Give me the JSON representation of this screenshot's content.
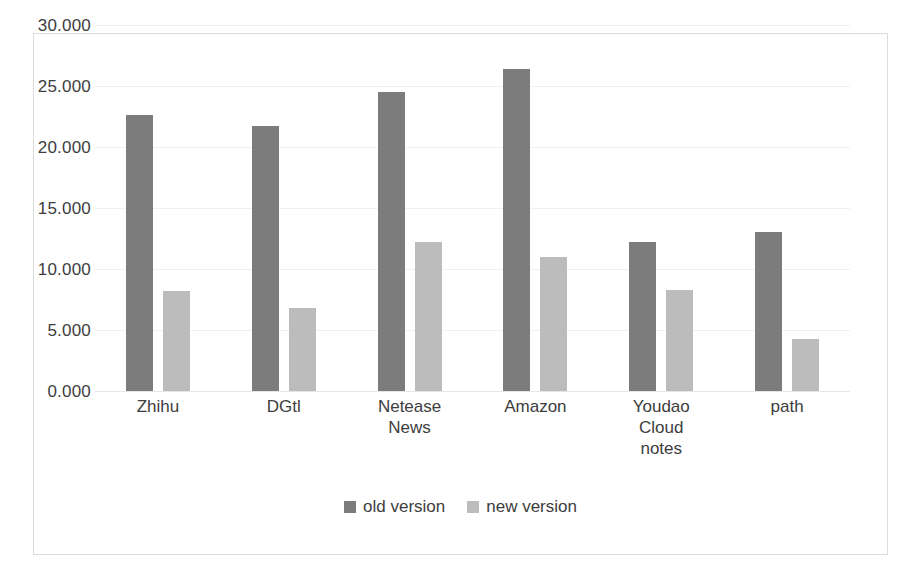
{
  "chart_data": {
    "type": "bar",
    "title": "",
    "subtitle": "",
    "xlabel": "",
    "ylabel": "",
    "ylim": [
      0,
      30
    ],
    "ytick_labels": [
      "30.000",
      "25.000",
      "20.000",
      "15.000",
      "10.000",
      "5.000",
      "0.000"
    ],
    "ytick_values": [
      30,
      25,
      20,
      15,
      10,
      5,
      0
    ],
    "grid": true,
    "legend_position": "bottom",
    "categories": [
      "Zhihu",
      "DGtl",
      "Netease\nNews",
      "Amazon",
      "Youdao\nCloud\nnotes",
      "path"
    ],
    "series": [
      {
        "name": "old version",
        "color": "#7c7c7c",
        "values": [
          22.6,
          21.7,
          24.5,
          26.4,
          12.2,
          13.0
        ]
      },
      {
        "name": "new version",
        "color": "#bcbcbc",
        "values": [
          8.2,
          6.8,
          12.2,
          11.0,
          8.3,
          4.3
        ]
      }
    ]
  },
  "legend": {
    "items": [
      {
        "label": "old version",
        "color": "#7c7c7c"
      },
      {
        "label": "new version",
        "color": "#bcbcbc"
      }
    ]
  }
}
